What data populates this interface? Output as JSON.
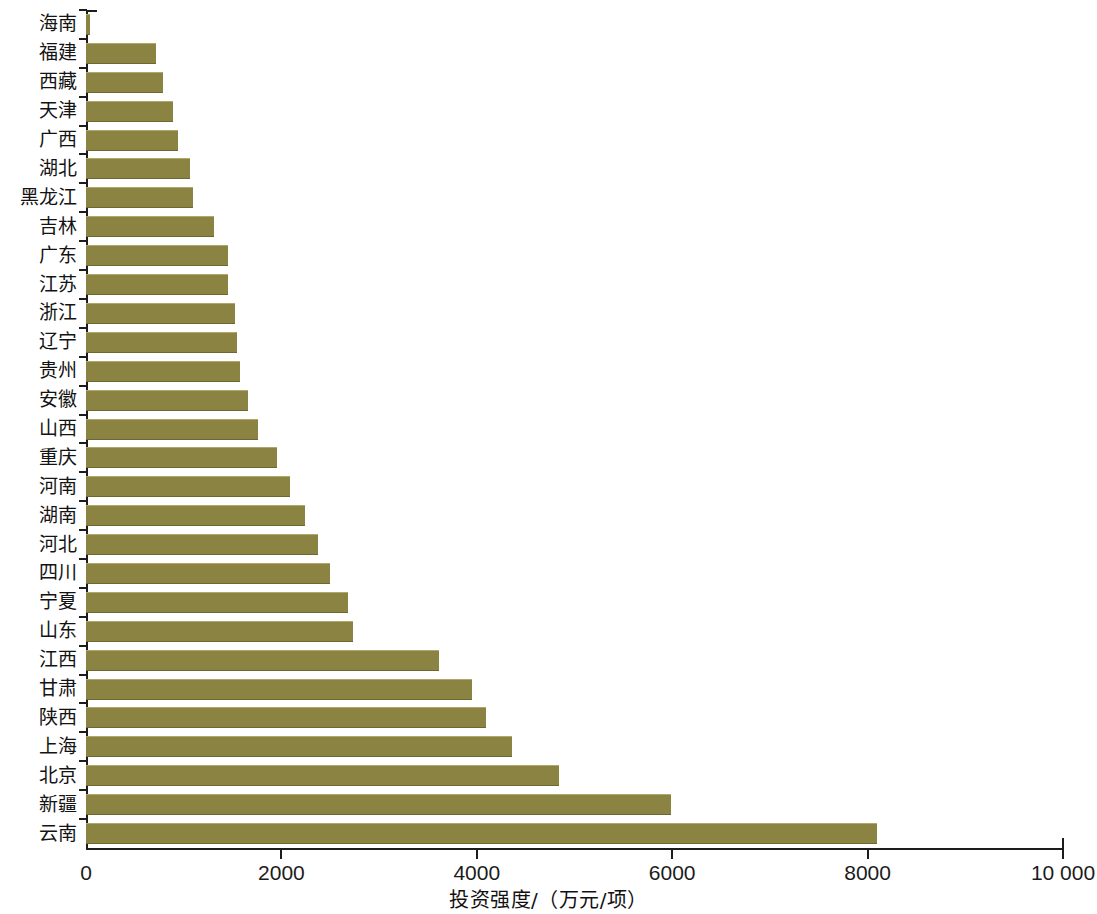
{
  "chart_data": {
    "type": "bar",
    "orientation": "horizontal",
    "title": "",
    "xlabel": "投资强度/（万元/项）",
    "ylabel": "",
    "xlim": [
      0,
      10000
    ],
    "grid": false,
    "legend": null,
    "bar_color": "#8b8341",
    "xticks": [
      0,
      2000,
      4000,
      6000,
      8000,
      10000
    ],
    "xtick_labels": [
      "0",
      "2000",
      "4000",
      "6000",
      "8000",
      "10 000"
    ],
    "categories": [
      "海南",
      "福建",
      "西藏",
      "天津",
      "广西",
      "湖北",
      "黑龙江",
      "吉林",
      "广东",
      "江苏",
      "浙江",
      "辽宁",
      "贵州",
      "安徽",
      "山西",
      "重庆",
      "河南",
      "湖南",
      "河北",
      "四川",
      "宁夏",
      "山东",
      "江西",
      "甘肃",
      "陕西",
      "上海",
      "北京",
      "新疆",
      "云南"
    ],
    "values": [
      40,
      715,
      790,
      890,
      940,
      1065,
      1095,
      1310,
      1455,
      1455,
      1525,
      1545,
      1575,
      1660,
      1760,
      1955,
      2090,
      2240,
      2375,
      2500,
      2680,
      2730,
      3610,
      3950,
      4095,
      4360,
      4840,
      5990,
      8100
    ]
  }
}
